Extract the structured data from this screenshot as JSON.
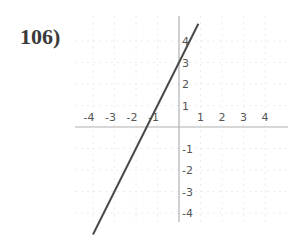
{
  "problem": {
    "number": "106)"
  },
  "chart_data": {
    "type": "line",
    "title": "",
    "xlabel": "",
    "ylabel": "",
    "xlim": [
      -4.5,
      4.5
    ],
    "ylim": [
      -5,
      5
    ],
    "grid": true,
    "x_tick_labels": [
      "-4",
      "-3",
      "-2",
      "-1",
      "1",
      "2",
      "3",
      "4"
    ],
    "y_tick_labels": [
      "4",
      "3",
      "2",
      "1",
      "-1",
      "-2",
      "-3",
      "-4"
    ],
    "series": [
      {
        "name": "y = 2x + 3",
        "slope": 2,
        "intercept": 3,
        "points": [
          {
            "x": -4.0,
            "y": -5.0
          },
          {
            "x": -1.5,
            "y": 0
          },
          {
            "x": 0,
            "y": 3
          },
          {
            "x": 1.0,
            "y": 5.0
          }
        ]
      }
    ]
  },
  "colors": {
    "axis": "#b0b0b0",
    "grid": "#ececec",
    "line": "#4a4a4a",
    "label": "#555555"
  }
}
